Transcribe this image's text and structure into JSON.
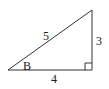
{
  "diagram": {
    "type": "right-triangle",
    "vertices": {
      "left": [
        8,
        70
      ],
      "right_angle": [
        92,
        70
      ],
      "top": [
        92,
        10
      ]
    },
    "labels": {
      "hypotenuse": "5",
      "vertical_leg": "3",
      "horizontal_leg": "4",
      "angle": "B"
    },
    "right_angle_marker": true,
    "colors": {
      "stroke": "#333333",
      "text": "#222222",
      "background": "#ffffff"
    }
  }
}
